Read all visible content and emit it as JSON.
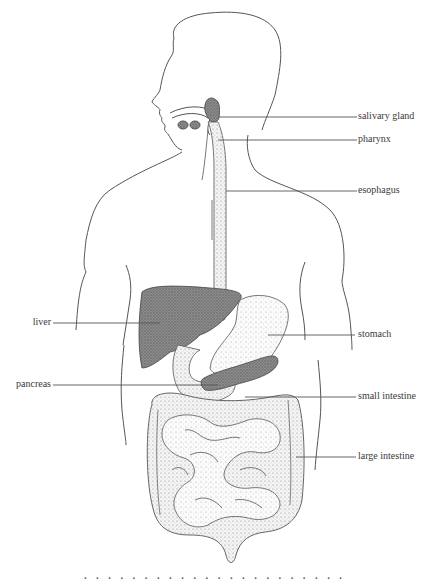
{
  "figure": {
    "labels": {
      "salivary_gland": "salivary gland",
      "pharynx": "pharynx",
      "esophagus": "esophagus",
      "liver": "liver",
      "stomach": "stomach",
      "pancreas": "pancreas",
      "small_intestine": "small intestine",
      "large_intestine": "large intestine"
    },
    "colors": {
      "line": "#555555",
      "organ_dark": "#7a7a7a",
      "organ_light": "#e4e4e4",
      "stipple": "#9a9a9a"
    }
  },
  "caption": {
    "text": "· · · ·   · · ·   · · ·   · · ·   · · · · ·   · · · ·"
  }
}
